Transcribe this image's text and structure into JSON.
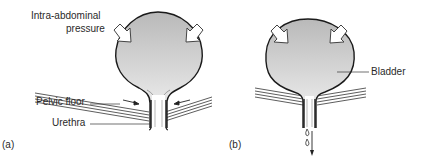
{
  "panels": [
    {
      "id": "a",
      "caption": "(a)",
      "labels": {
        "pressure_line1": "Intra-abdominal",
        "pressure_line2": "pressure",
        "pelvic_floor": "Pelvic floor",
        "urethra": "Urethra"
      },
      "state": "continent - pelvic floor contracted, urethra closed"
    },
    {
      "id": "b",
      "caption": "(b)",
      "labels": {
        "bladder": "Bladder"
      },
      "state": "leakage - pelvic floor relaxed, urine drips"
    }
  ],
  "colors": {
    "outline": "#1a1a1a",
    "fill_light": "#f4f4f4",
    "fill_dark": "#bdbdbd",
    "arrow_fill": "#ffffff",
    "text": "#2a2a2a"
  }
}
